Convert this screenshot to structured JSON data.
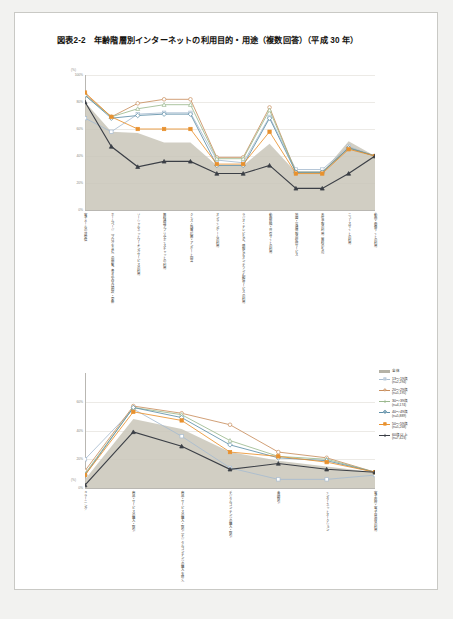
{
  "document": {
    "title": "図表2-2　年齢階層別インターネットの利用目的・用途（複数回答）（平成 30 年）"
  },
  "legend": {
    "items": [
      {
        "label": "全体",
        "n": "",
        "color": "#b5b2a6",
        "marker": "area"
      },
      {
        "label": "13〜19歳",
        "n": "(n=2,294)",
        "color": "#a8bcd0",
        "marker": "square"
      },
      {
        "label": "20〜29歳",
        "n": "(n=5,195)",
        "color": "#c98f5e",
        "marker": "circle"
      },
      {
        "label": "30〜39歳",
        "n": "(n=4,174)",
        "color": "#9cb98f",
        "marker": "triangle"
      },
      {
        "label": "40〜49歳",
        "n": "(n=5,889)",
        "color": "#5e8fa8",
        "marker": "diamond"
      },
      {
        "label": "50〜59歳",
        "n": "(n=5,268)",
        "color": "#e8912e",
        "marker": "fsquare"
      },
      {
        "label": "60歳以上",
        "n": "(n=7,423)",
        "color": "#3b3f46",
        "marker": "ftriangle"
      }
    ]
  },
  "chart_data": [
    {
      "type": "line",
      "title": "",
      "xlabel": "",
      "ylabel": "",
      "unit": "(%)",
      "ylim": [
        0,
        100
      ],
      "yticks": [
        "0%",
        "20%",
        "40%",
        "60%",
        "80%",
        "100%"
      ],
      "grid": true,
      "legend_position": "right",
      "categories": [
        "電子メールの送受信",
        "ホームページ（ブログを含む）の閲覧、書き込み又は開設・更新",
        "ソーシャルネットワーキングサービスの利用",
        "無料通話アプリやボイスチャットの利用",
        "クイズ・懸賞応募・アンケート回答",
        "オンラインゲームの利用",
        "ラジオ・テレビなど、情報などオンデマンド配信サービスの利用",
        "動画投稿・共有サイトの利用",
        "地図・交通情報の提供サービス",
        "天気予報の利用（無料のもの）",
        "ニュースサイトの利用",
        "動画・画像サイトの利用"
      ],
      "series": [
        {
          "name": "全体",
          "values": [
            80,
            58,
            57,
            50,
            50,
            33,
            33,
            49,
            28,
            28,
            51,
            40
          ]
        },
        {
          "name": "13〜19歳",
          "values": [
            68,
            58,
            71,
            72,
            72,
            37,
            35,
            69,
            30,
            30,
            47,
            40
          ]
        },
        {
          "name": "20〜29歳",
          "values": [
            86,
            69,
            79,
            82,
            82,
            39,
            39,
            76,
            28,
            28,
            46,
            40
          ]
        },
        {
          "name": "30〜39歳",
          "values": [
            85,
            69,
            75,
            78,
            78,
            38,
            38,
            74,
            28,
            28,
            46,
            40
          ]
        },
        {
          "name": "40〜49歳",
          "values": [
            85,
            68,
            70,
            71,
            71,
            33,
            33,
            68,
            28,
            28,
            46,
            40
          ]
        },
        {
          "name": "50〜59歳",
          "values": [
            87,
            69,
            60,
            60,
            60,
            34,
            34,
            58,
            27,
            27,
            45,
            40
          ]
        },
        {
          "name": "60歳以上",
          "values": [
            80,
            47,
            32,
            36,
            36,
            27,
            27,
            33,
            16,
            16,
            27,
            40
          ]
        }
      ]
    },
    {
      "type": "line",
      "title": "",
      "xlabel": "",
      "ylabel": "",
      "unit": "(%)",
      "ylim": [
        0,
        80
      ],
      "yticks": [
        "0%",
        "20%",
        "40%",
        "60%"
      ],
      "grid": true,
      "legend_position": "right",
      "categories": [
        "e ラーニング",
        "商品・サービスの購入・取引",
        "商品・サービスの購入・取引（デジタルコンテンツの購入を除く）",
        "デジタルコンテンツの購入・取引",
        "金融取引",
        "インターネットオークション",
        "電子政府・電子自治体の利用"
      ],
      "series": [
        {
          "name": "全体",
          "values": [
            6,
            48,
            41,
            25,
            19,
            15,
            11
          ]
        },
        {
          "name": "13〜19歳",
          "values": [
            20,
            55,
            36,
            14,
            6,
            6,
            9
          ]
        },
        {
          "name": "20〜29歳",
          "values": [
            12,
            57,
            52,
            44,
            25,
            21,
            11
          ]
        },
        {
          "name": "30〜39歳",
          "values": [
            10,
            56,
            51,
            33,
            22,
            20,
            11
          ]
        },
        {
          "name": "40〜49歳",
          "values": [
            9,
            56,
            49,
            30,
            21,
            19,
            11
          ]
        },
        {
          "name": "50〜59歳",
          "values": [
            9,
            53,
            47,
            25,
            22,
            18,
            11
          ]
        },
        {
          "name": "60歳以上",
          "values": [
            2,
            39,
            29,
            13,
            17,
            13,
            11
          ]
        }
      ]
    }
  ]
}
